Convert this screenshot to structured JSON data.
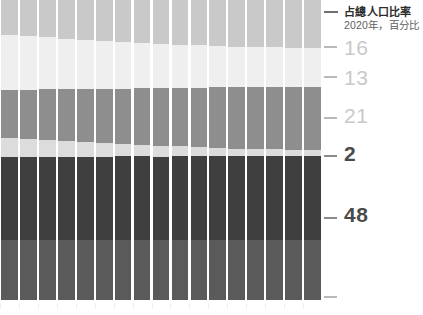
{
  "chart_data": {
    "type": "bar",
    "title": "占總人口比率",
    "subtitle": "2020年，百分比",
    "xlabel": "",
    "ylabel": "",
    "stacked": true,
    "orientation": "vertical",
    "grid": false,
    "legend_position": "top-right",
    "note": "Cropped stacked column chart; right-edge end-labels give the 2020 share of each band.",
    "ylim": [
      0,
      100
    ],
    "categories": [
      "c1",
      "c2",
      "c3",
      "c4",
      "c5",
      "c6",
      "c7",
      "c8",
      "c9",
      "c10",
      "c11",
      "c12",
      "c13",
      "c14",
      "c15",
      "c16",
      "c17"
    ],
    "series": [
      {
        "name": "band-1",
        "end_label": "16",
        "color": "#c9c9c9",
        "values": [
          11.5,
          12.0,
          12.4,
          12.9,
          13.3,
          13.7,
          14.0,
          14.3,
          14.6,
          14.9,
          15.1,
          15.3,
          15.5,
          15.7,
          15.8,
          15.9,
          16.0
        ]
      },
      {
        "name": "band-2",
        "end_label": "13",
        "color": "#efefef",
        "values": [
          18.5,
          18.0,
          17.4,
          16.9,
          16.4,
          16.0,
          15.5,
          15.1,
          14.8,
          14.4,
          14.1,
          13.8,
          13.6,
          13.4,
          13.2,
          13.1,
          13.0
        ]
      },
      {
        "name": "band-3",
        "end_label": "21",
        "color": "#8e8e8e",
        "values": [
          16.0,
          16.4,
          16.8,
          17.2,
          17.6,
          18.0,
          18.4,
          18.8,
          19.2,
          19.5,
          19.8,
          20.1,
          20.4,
          20.6,
          20.8,
          20.9,
          21.0
        ]
      },
      {
        "name": "band-4",
        "end_label": "2",
        "color": "#dcdcdc",
        "values": [
          6.4,
          6.1,
          5.7,
          5.3,
          4.9,
          4.6,
          4.2,
          3.9,
          3.6,
          3.3,
          3.0,
          2.8,
          2.6,
          2.4,
          2.2,
          2.1,
          2.0
        ]
      },
      {
        "name": "band-5",
        "end_label": "48",
        "color": "#3f3f3f",
        "values": [
          47.6,
          47.5,
          47.7,
          47.7,
          47.8,
          47.7,
          47.9,
          47.9,
          47.8,
          47.9,
          48.0,
          48.0,
          47.9,
          47.9,
          48.0,
          48.0,
          48.0
        ]
      }
    ],
    "axis_labels": [
      {
        "text": "16",
        "value": 16,
        "emphasis": "muted"
      },
      {
        "text": "13",
        "value": 13,
        "emphasis": "muted"
      },
      {
        "text": "21",
        "value": 21,
        "emphasis": "muted"
      },
      {
        "text": "2",
        "value": 2,
        "emphasis": "bold"
      },
      {
        "text": "48",
        "value": 48,
        "emphasis": "bold"
      }
    ]
  },
  "legend": {
    "title": "占總人口比率",
    "subtitle": "2020年，百分比"
  },
  "axis": {
    "labels": [
      "16",
      "13",
      "21",
      "2",
      "48"
    ]
  }
}
